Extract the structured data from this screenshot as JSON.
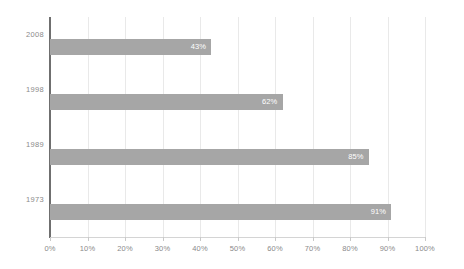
{
  "chart_data": {
    "type": "bar",
    "orientation": "horizontal",
    "title": "",
    "subtitle": "",
    "xlabel": "",
    "ylabel": "",
    "categories": [
      "2008",
      "1998",
      "1989",
      "1973"
    ],
    "values": [
      43,
      62,
      85,
      91
    ],
    "value_labels": [
      "43%",
      "62%",
      "85%",
      "91%"
    ],
    "series": [
      {
        "name": "",
        "values": [
          43,
          62,
          85,
          91
        ]
      }
    ],
    "xlim": [
      0,
      100
    ],
    "xticks": [
      0,
      10,
      20,
      30,
      40,
      50,
      60,
      70,
      80,
      90,
      100
    ],
    "xtick_labels": [
      "0%",
      "10%",
      "20%",
      "30%",
      "40%",
      "50%",
      "60%",
      "70%",
      "80%",
      "90%",
      "100%"
    ],
    "grid": "vertical",
    "legend": "none",
    "annotations": []
  },
  "style": {
    "bar_color": "#a6a6a6",
    "bar_label_color": "#ffffff",
    "axis_line_color": "#6f6f6f",
    "gridline_color": "#e9e9e9",
    "tick_label_color": "#8a8a8a",
    "background": "#ffffff"
  }
}
